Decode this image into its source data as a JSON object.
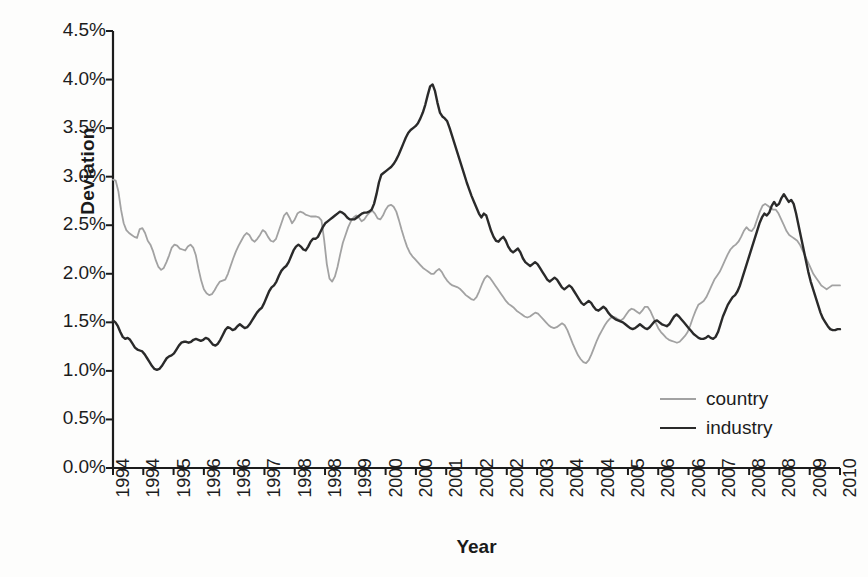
{
  "chart_data": {
    "type": "line",
    "title": "",
    "xlabel": "Year",
    "ylabel": "Deviation",
    "ylim": [
      0.0,
      4.5
    ],
    "ytick_labels": [
      "4.5%",
      "4.0%",
      "3.5%",
      "3.0%",
      "2.5%",
      "2.0%",
      "1.5%",
      "1.0%",
      "0.5%",
      "0.0%"
    ],
    "ytick_values": [
      4.5,
      4.0,
      3.5,
      3.0,
      2.5,
      2.0,
      1.5,
      1.0,
      0.5,
      0.0
    ],
    "ytick_format": "percent",
    "xtick_labels": [
      "1994",
      "1994",
      "1995",
      "1996",
      "1996",
      "1997",
      "1998",
      "1998",
      "1999",
      "2000",
      "2000",
      "2001",
      "2002",
      "2002",
      "2003",
      "2004",
      "2004",
      "2005",
      "2006",
      "2006",
      "2007",
      "2008",
      "2008",
      "2009",
      "2010"
    ],
    "xlim": [
      1994.0,
      2010.5
    ],
    "grid": false,
    "legend_position": "center-right",
    "axis_color": "#1c1c1c",
    "background": "#fdfdfc",
    "series": [
      {
        "name": "country",
        "color": "#a2a2a2",
        "values": [
          2.97,
          2.96,
          2.85,
          2.66,
          2.52,
          2.45,
          2.42,
          2.4,
          2.38,
          2.37,
          2.46,
          2.47,
          2.42,
          2.34,
          2.3,
          2.23,
          2.14,
          2.07,
          2.04,
          2.06,
          2.12,
          2.19,
          2.27,
          2.3,
          2.29,
          2.26,
          2.25,
          2.24,
          2.28,
          2.3,
          2.27,
          2.19,
          2.05,
          1.93,
          1.84,
          1.8,
          1.78,
          1.79,
          1.83,
          1.88,
          1.92,
          1.93,
          1.94,
          2.0,
          2.08,
          2.16,
          2.23,
          2.29,
          2.34,
          2.39,
          2.42,
          2.4,
          2.35,
          2.33,
          2.36,
          2.4,
          2.45,
          2.43,
          2.38,
          2.34,
          2.33,
          2.36,
          2.44,
          2.52,
          2.6,
          2.63,
          2.58,
          2.52,
          2.56,
          2.62,
          2.64,
          2.63,
          2.61,
          2.6,
          2.59,
          2.59,
          2.59,
          2.58,
          2.55,
          2.35,
          2.1,
          1.95,
          1.92,
          1.97,
          2.07,
          2.2,
          2.32,
          2.4,
          2.48,
          2.54,
          2.58,
          2.6,
          2.58,
          2.54,
          2.56,
          2.6,
          2.63,
          2.65,
          2.62,
          2.57,
          2.56,
          2.6,
          2.66,
          2.7,
          2.71,
          2.69,
          2.64,
          2.55,
          2.45,
          2.36,
          2.28,
          2.22,
          2.18,
          2.15,
          2.12,
          2.09,
          2.06,
          2.04,
          2.02,
          2.0,
          2.0,
          2.03,
          2.05,
          2.02,
          1.97,
          1.93,
          1.9,
          1.88,
          1.87,
          1.86,
          1.84,
          1.81,
          1.78,
          1.76,
          1.74,
          1.73,
          1.76,
          1.82,
          1.89,
          1.95,
          1.98,
          1.96,
          1.92,
          1.88,
          1.84,
          1.8,
          1.76,
          1.72,
          1.69,
          1.67,
          1.65,
          1.62,
          1.6,
          1.58,
          1.56,
          1.55,
          1.56,
          1.58,
          1.6,
          1.59,
          1.56,
          1.53,
          1.5,
          1.47,
          1.45,
          1.44,
          1.45,
          1.47,
          1.49,
          1.47,
          1.42,
          1.35,
          1.28,
          1.22,
          1.16,
          1.12,
          1.09,
          1.08,
          1.11,
          1.17,
          1.24,
          1.31,
          1.37,
          1.42,
          1.47,
          1.51,
          1.54,
          1.56,
          1.55,
          1.53,
          1.52,
          1.54,
          1.58,
          1.62,
          1.64,
          1.63,
          1.61,
          1.59,
          1.62,
          1.66,
          1.66,
          1.62,
          1.56,
          1.5,
          1.44,
          1.4,
          1.37,
          1.34,
          1.32,
          1.31,
          1.3,
          1.29,
          1.3,
          1.33,
          1.36,
          1.4,
          1.47,
          1.55,
          1.62,
          1.68,
          1.7,
          1.72,
          1.76,
          1.82,
          1.88,
          1.94,
          1.98,
          2.02,
          2.08,
          2.14,
          2.2,
          2.25,
          2.28,
          2.3,
          2.33,
          2.38,
          2.44,
          2.48,
          2.45,
          2.44,
          2.48,
          2.56,
          2.64,
          2.7,
          2.72,
          2.7,
          2.68,
          2.66,
          2.66,
          2.62,
          2.56,
          2.5,
          2.44,
          2.4,
          2.38,
          2.36,
          2.34,
          2.3,
          2.24,
          2.18,
          2.12,
          2.06,
          2.0,
          1.96,
          1.92,
          1.88,
          1.86,
          1.84,
          1.86,
          1.88,
          1.88,
          1.88,
          1.88
        ]
      },
      {
        "name": "industry",
        "color": "#2a2a2a",
        "values": [
          1.52,
          1.5,
          1.46,
          1.4,
          1.35,
          1.33,
          1.34,
          1.32,
          1.28,
          1.24,
          1.22,
          1.21,
          1.2,
          1.17,
          1.13,
          1.09,
          1.05,
          1.02,
          1.01,
          1.02,
          1.05,
          1.09,
          1.13,
          1.15,
          1.16,
          1.18,
          1.22,
          1.26,
          1.29,
          1.3,
          1.3,
          1.29,
          1.3,
          1.32,
          1.33,
          1.32,
          1.31,
          1.32,
          1.34,
          1.33,
          1.3,
          1.27,
          1.26,
          1.28,
          1.32,
          1.37,
          1.42,
          1.45,
          1.44,
          1.42,
          1.43,
          1.46,
          1.48,
          1.46,
          1.44,
          1.45,
          1.48,
          1.52,
          1.56,
          1.6,
          1.63,
          1.65,
          1.7,
          1.76,
          1.82,
          1.86,
          1.88,
          1.92,
          1.98,
          2.03,
          2.06,
          2.08,
          2.12,
          2.18,
          2.24,
          2.28,
          2.3,
          2.28,
          2.25,
          2.24,
          2.28,
          2.33,
          2.36,
          2.36,
          2.38,
          2.43,
          2.48,
          2.52,
          2.54,
          2.56,
          2.58,
          2.6,
          2.62,
          2.64,
          2.63,
          2.61,
          2.58,
          2.56,
          2.56,
          2.56,
          2.58,
          2.6,
          2.62,
          2.63,
          2.63,
          2.64,
          2.66,
          2.72,
          2.82,
          2.94,
          3.02,
          3.04,
          3.06,
          3.08,
          3.1,
          3.13,
          3.17,
          3.22,
          3.28,
          3.34,
          3.4,
          3.45,
          3.48,
          3.5,
          3.52,
          3.55,
          3.6,
          3.66,
          3.74,
          3.84,
          3.93,
          3.95,
          3.88,
          3.76,
          3.66,
          3.62,
          3.6,
          3.57,
          3.5,
          3.42,
          3.34,
          3.26,
          3.18,
          3.1,
          3.02,
          2.94,
          2.87,
          2.8,
          2.74,
          2.68,
          2.62,
          2.58,
          2.62,
          2.6,
          2.52,
          2.44,
          2.38,
          2.34,
          2.33,
          2.36,
          2.38,
          2.34,
          2.28,
          2.24,
          2.22,
          2.24,
          2.26,
          2.22,
          2.16,
          2.12,
          2.1,
          2.08,
          2.1,
          2.12,
          2.1,
          2.06,
          2.02,
          1.98,
          1.94,
          1.92,
          1.94,
          1.96,
          1.94,
          1.9,
          1.86,
          1.84,
          1.86,
          1.88,
          1.86,
          1.82,
          1.78,
          1.74,
          1.7,
          1.68,
          1.7,
          1.72,
          1.7,
          1.66,
          1.63,
          1.62,
          1.64,
          1.66,
          1.64,
          1.6,
          1.57,
          1.55,
          1.53,
          1.52,
          1.51,
          1.5,
          1.48,
          1.46,
          1.44,
          1.43,
          1.44,
          1.46,
          1.48,
          1.46,
          1.44,
          1.43,
          1.45,
          1.48,
          1.51,
          1.52,
          1.5,
          1.48,
          1.47,
          1.46,
          1.48,
          1.52,
          1.56,
          1.58,
          1.56,
          1.53,
          1.5,
          1.47,
          1.44,
          1.41,
          1.38,
          1.36,
          1.34,
          1.33,
          1.33,
          1.34,
          1.36,
          1.34,
          1.33,
          1.35,
          1.4,
          1.48,
          1.56,
          1.62,
          1.68,
          1.72,
          1.76,
          1.78,
          1.82,
          1.88,
          1.96,
          2.04,
          2.12,
          2.2,
          2.28,
          2.36,
          2.44,
          2.52,
          2.58,
          2.62,
          2.6,
          2.63,
          2.7,
          2.74,
          2.7,
          2.72,
          2.78,
          2.82,
          2.78,
          2.74,
          2.76,
          2.72,
          2.62,
          2.5,
          2.38,
          2.26,
          2.14,
          2.02,
          1.92,
          1.84,
          1.76,
          1.68,
          1.6,
          1.54,
          1.5,
          1.46,
          1.43,
          1.42,
          1.42,
          1.43,
          1.43
        ]
      }
    ]
  },
  "legend": {
    "items": [
      {
        "label": "country",
        "color": "#a2a2a2"
      },
      {
        "label": "industry",
        "color": "#2a2a2a"
      }
    ]
  }
}
